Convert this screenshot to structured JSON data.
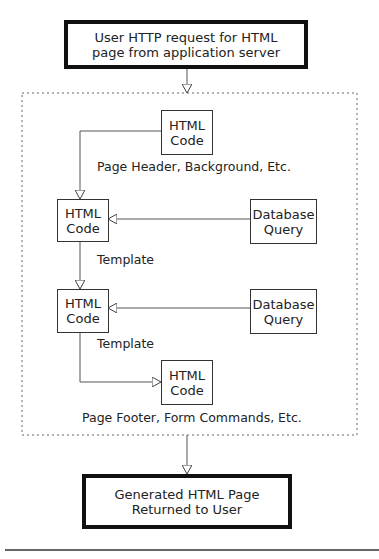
{
  "top_box": {
    "line1": "User HTTP request for HTML",
    "line2": "page from application server"
  },
  "html_code_1": {
    "line1": "HTML",
    "line2": "Code"
  },
  "label_header": "Page Header, Background, Etc.",
  "html_code_2": {
    "line1": "HTML",
    "line2": "Code"
  },
  "db_query_1": {
    "line1": "Database",
    "line2": "Query"
  },
  "label_template_1": "Template",
  "html_code_3": {
    "line1": "HTML",
    "line2": "Code"
  },
  "db_query_2": {
    "line1": "Database",
    "line2": "Query"
  },
  "label_template_2": "Template",
  "html_code_4": {
    "line1": "HTML",
    "line2": "Code"
  },
  "label_footer": "Page Footer, Form Commands, Etc.",
  "bottom_box": {
    "line1": "Generated HTML Page",
    "line2": "Returned to User"
  }
}
